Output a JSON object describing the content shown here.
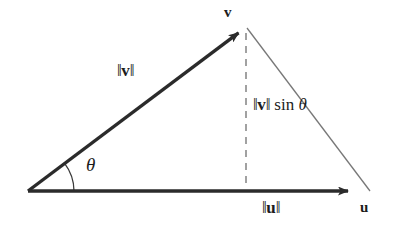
{
  "figure": {
    "background_color": "#ffffff",
    "width": 398,
    "height": 247
  },
  "labels": {
    "v_vector": "v",
    "u_vector": "u",
    "norm_v": "‖v‖",
    "norm_v_bar_open": "‖",
    "norm_v_letter": "v",
    "norm_v_bar_close": "‖",
    "norm_u_bar_open": "‖",
    "norm_u_letter": "u",
    "norm_u_bar_close": "‖",
    "norm_u": "‖u‖",
    "height_expression": "‖v‖ sin θ",
    "height_function": " sin ",
    "theta": "θ",
    "angle_theta": "θ"
  },
  "colors": {
    "vector_stroke": "#2b2b2b",
    "thin_line_stroke": "#777777",
    "dashed_line_stroke": "#888888",
    "text": "#1c1c1c",
    "background": "#ffffff"
  },
  "geometry": {
    "origin": {
      "x": 28,
      "y": 191
    },
    "apex": {
      "x": 246,
      "y": 27
    },
    "right_vertex": {
      "x": 370,
      "y": 191
    },
    "u_arrow_tip": {
      "x": 357,
      "y": 191
    },
    "foot_of_height": {
      "x": 246,
      "y": 191
    },
    "angle_arc_radius": 46,
    "angle_degrees": 37
  },
  "elements": {
    "v_arrow_name": "vector-v-arrow",
    "u_arrow_name": "vector-u-arrow",
    "dashed_height_name": "dashed-height-line",
    "hypotenuse_name": "thin-hypotenuse-line",
    "angle_arc_name": "angle-arc"
  }
}
